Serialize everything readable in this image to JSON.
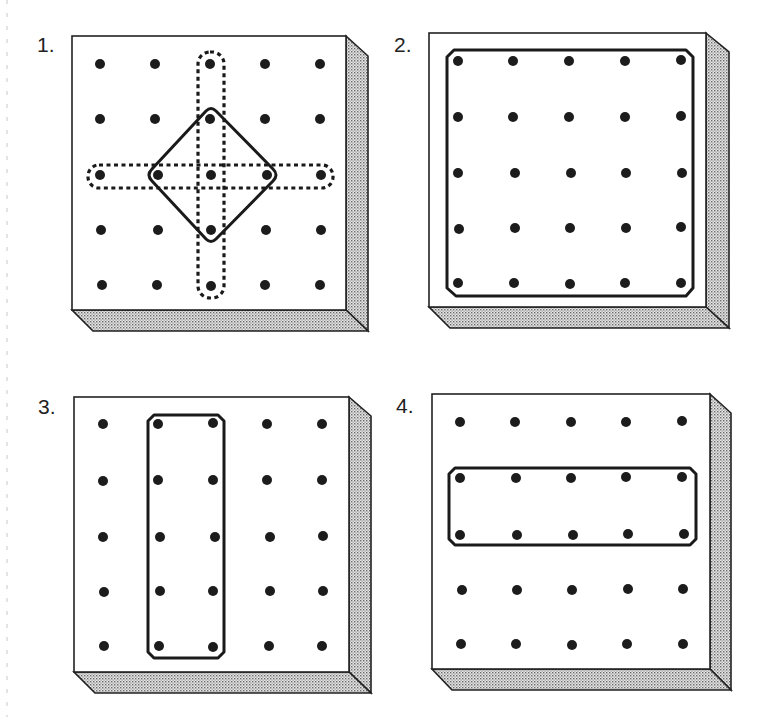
{
  "figure": {
    "colors": {
      "ink": "#1c1c1c",
      "board_face": "#ffffff",
      "board_side_stipple": "#9a9a9a"
    },
    "boards": [
      {
        "label": "1.",
        "rows": 5,
        "cols": 5,
        "shapes": [
          {
            "style": "solid",
            "kind": "diamond (square rotated 45°)",
            "vertices": [
              "r1c2",
              "r2c3",
              "r3c2",
              "r2c1"
            ]
          },
          {
            "style": "dashed",
            "kind": "vertical band",
            "span": "column 2, rows 0–4"
          },
          {
            "style": "dashed",
            "kind": "horizontal band",
            "span": "row 2, columns 0–4"
          }
        ]
      },
      {
        "label": "2.",
        "rows": 5,
        "cols": 5,
        "shapes": [
          {
            "style": "solid",
            "kind": "square",
            "span": "rows 0–4, columns 0–4"
          }
        ]
      },
      {
        "label": "3.",
        "rows": 5,
        "cols": 5,
        "shapes": [
          {
            "style": "solid",
            "kind": "rectangle",
            "span": "rows 0–4, columns 1–2"
          }
        ]
      },
      {
        "label": "4.",
        "rows": 5,
        "cols": 5,
        "shapes": [
          {
            "style": "solid",
            "kind": "rectangle",
            "span": "rows 1–2, columns 0–4"
          }
        ]
      }
    ]
  }
}
